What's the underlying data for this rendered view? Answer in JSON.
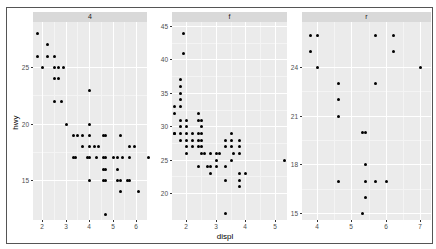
{
  "chart_data": {
    "type": "scatter",
    "title": "",
    "xlabel": "displ",
    "ylabel": "hwy",
    "facet_by": "drv",
    "grid": true,
    "panels": [
      {
        "strip": "4",
        "x_ticks": [
          2,
          3,
          4,
          5,
          6
        ],
        "y_ticks": [
          15,
          20,
          25
        ],
        "xlim": [
          1.6,
          6.6
        ],
        "ylim": [
          11.5,
          29
        ],
        "points": [
          [
            1.8,
            28
          ],
          [
            1.8,
            26
          ],
          [
            2.0,
            25
          ],
          [
            2.2,
            27
          ],
          [
            2.2,
            26
          ],
          [
            2.5,
            25
          ],
          [
            2.5,
            26
          ],
          [
            2.5,
            24
          ],
          [
            2.5,
            22
          ],
          [
            2.7,
            25
          ],
          [
            2.7,
            24
          ],
          [
            2.8,
            22
          ],
          [
            2.9,
            25
          ],
          [
            3.0,
            20
          ],
          [
            4.0,
            23
          ],
          [
            4.0,
            20
          ],
          [
            3.3,
            19
          ],
          [
            3.5,
            19
          ],
          [
            3.7,
            19
          ],
          [
            4.0,
            19
          ],
          [
            4.6,
            19
          ],
          [
            4.7,
            19
          ],
          [
            5.3,
            19
          ],
          [
            3.7,
            18
          ],
          [
            4.0,
            18
          ],
          [
            4.2,
            18
          ],
          [
            4.4,
            18
          ],
          [
            5.7,
            18
          ],
          [
            5.9,
            18
          ],
          [
            3.3,
            17
          ],
          [
            3.4,
            17
          ],
          [
            3.9,
            17
          ],
          [
            4.0,
            17
          ],
          [
            4.3,
            17
          ],
          [
            4.6,
            17
          ],
          [
            4.7,
            17
          ],
          [
            5.0,
            17
          ],
          [
            5.2,
            17
          ],
          [
            5.4,
            17
          ],
          [
            5.7,
            17
          ],
          [
            6.5,
            17
          ],
          [
            4.7,
            16
          ],
          [
            4.6,
            16
          ],
          [
            5.2,
            16
          ],
          [
            4.0,
            15
          ],
          [
            4.6,
            15
          ],
          [
            4.7,
            15
          ],
          [
            5.2,
            15
          ],
          [
            5.3,
            15
          ],
          [
            5.6,
            15
          ],
          [
            5.7,
            15
          ],
          [
            5.3,
            14
          ],
          [
            6.1,
            14
          ],
          [
            4.7,
            12
          ]
        ]
      },
      {
        "strip": "f",
        "x_ticks": [
          2,
          3,
          4,
          5
        ],
        "y_ticks": [
          20,
          25,
          30,
          35,
          40,
          45
        ],
        "xlim": [
          1.55,
          5.4
        ],
        "ylim": [
          16,
          45.5
        ],
        "points": [
          [
            1.9,
            44
          ],
          [
            1.9,
            41
          ],
          [
            1.8,
            37
          ],
          [
            1.8,
            36
          ],
          [
            1.8,
            35
          ],
          [
            1.8,
            34
          ],
          [
            1.8,
            33
          ],
          [
            1.6,
            33
          ],
          [
            1.6,
            32
          ],
          [
            1.8,
            31
          ],
          [
            2.0,
            31
          ],
          [
            2.4,
            31
          ],
          [
            2.4,
            32
          ],
          [
            2.5,
            31
          ],
          [
            1.6,
            29
          ],
          [
            1.8,
            29
          ],
          [
            2.0,
            29
          ],
          [
            2.2,
            29
          ],
          [
            2.4,
            29
          ],
          [
            2.5,
            29
          ],
          [
            2.5,
            30
          ],
          [
            2.0,
            30
          ],
          [
            1.8,
            30
          ],
          [
            1.6,
            29
          ],
          [
            1.8,
            28
          ],
          [
            2.0,
            28
          ],
          [
            2.2,
            28
          ],
          [
            2.4,
            28
          ],
          [
            2.5,
            28
          ],
          [
            2.0,
            27
          ],
          [
            2.2,
            27
          ],
          [
            2.4,
            27
          ],
          [
            2.5,
            27
          ],
          [
            2.8,
            26
          ],
          [
            3.0,
            26
          ],
          [
            3.1,
            26
          ],
          [
            3.3,
            27
          ],
          [
            3.5,
            27
          ],
          [
            3.8,
            27
          ],
          [
            3.3,
            28
          ],
          [
            3.5,
            28
          ],
          [
            3.8,
            28
          ],
          [
            3.5,
            29
          ],
          [
            2.0,
            26
          ],
          [
            2.5,
            26
          ],
          [
            2.6,
            26
          ],
          [
            3.0,
            25
          ],
          [
            3.5,
            25
          ],
          [
            3.8,
            26
          ],
          [
            3.6,
            26
          ],
          [
            2.4,
            24
          ],
          [
            2.7,
            24
          ],
          [
            2.8,
            24
          ],
          [
            3.0,
            24
          ],
          [
            3.3,
            24
          ],
          [
            2.8,
            23
          ],
          [
            3.8,
            23
          ],
          [
            4.0,
            23
          ],
          [
            3.3,
            22
          ],
          [
            3.8,
            22
          ],
          [
            3.8,
            21
          ],
          [
            3.3,
            17
          ],
          [
            5.3,
            25
          ]
        ]
      },
      {
        "strip": "r",
        "x_ticks": [
          4,
          5,
          6,
          7
        ],
        "y_ticks": [
          15,
          18,
          21,
          24
        ],
        "xlim": [
          3.8,
          7.0
        ],
        "ylim": [
          14.5,
          26.5
        ],
        "points": [
          [
            3.8,
            26
          ],
          [
            4.0,
            26
          ],
          [
            5.7,
            26
          ],
          [
            6.2,
            26
          ],
          [
            3.8,
            25
          ],
          [
            6.2,
            25
          ],
          [
            4.0,
            24
          ],
          [
            7.0,
            24
          ],
          [
            4.6,
            23
          ],
          [
            5.7,
            23
          ],
          [
            4.6,
            22
          ],
          [
            4.6,
            21
          ],
          [
            5.3,
            20
          ],
          [
            5.4,
            20
          ],
          [
            5.4,
            18
          ],
          [
            4.6,
            17
          ],
          [
            5.4,
            17
          ],
          [
            5.7,
            17
          ],
          [
            6.0,
            17
          ],
          [
            5.4,
            16
          ],
          [
            5.3,
            15
          ]
        ]
      }
    ]
  },
  "axes": {
    "x_title": "displ",
    "y_title": "hwy"
  },
  "strips": [
    "4",
    "f",
    "r"
  ]
}
